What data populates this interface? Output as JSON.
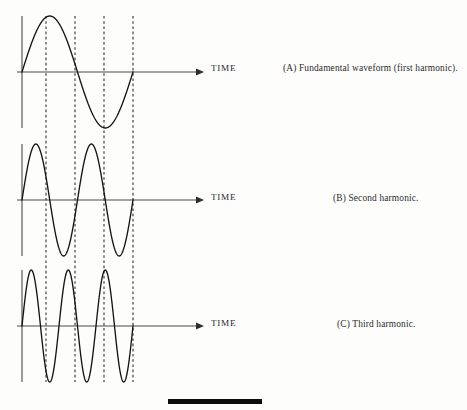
{
  "figure": {
    "background_color": "#fdfdfc",
    "ink_color": "#1a1a1a",
    "dashed_color": "#3a3a3a",
    "axis_color": "#4a4a4a"
  },
  "panels": [
    {
      "id": "A",
      "caption": "(A) Fundamental waveform (first harmonic).",
      "axis_label": "TIME",
      "harmonic_number": 1,
      "cycles": 1,
      "baseline_y": 72,
      "amplitude": 56
    },
    {
      "id": "B",
      "caption": "(B) Second harmonic.",
      "axis_label": "TIME",
      "harmonic_number": 2,
      "cycles": 2,
      "baseline_y": 200,
      "amplitude": 56
    },
    {
      "id": "C",
      "caption": "(C) Third harmonic.",
      "axis_label": "TIME",
      "harmonic_number": 3,
      "cycles": 3,
      "baseline_y": 326,
      "amplitude": 56
    }
  ],
  "geometry": {
    "origin_x": 22,
    "wave_end_x": 133,
    "axis_end_x": 203,
    "arrow_size": 5,
    "vertical_axis_top_a": 16,
    "vertical_axis_bottom_a": 128,
    "vertical_axis_top_b": 144,
    "vertical_axis_bottom_b": 256,
    "vertical_axis_top_c": 270,
    "vertical_axis_bottom_c": 382,
    "dashed_lines_x": [
      46,
      75,
      104,
      133
    ],
    "dashed_top": 16,
    "dashed_bottom": 382
  },
  "footer_rule": {
    "x": 168,
    "y": 399,
    "width": 94,
    "height": 5,
    "color": "#0d0d0d"
  },
  "chart_data": {
    "type": "line",
    "xlabel": "TIME",
    "ylabel": "",
    "x_range": [
      0,
      1
    ],
    "y_range": [
      -1,
      1
    ],
    "grid": false,
    "legend": "none",
    "series": [
      {
        "name": "(A) Fundamental waveform (first harmonic).",
        "waveform": "sine",
        "cycles_over_range": 1,
        "amplitude": 1,
        "phase_deg": 0
      },
      {
        "name": "(B) Second harmonic.",
        "waveform": "sine",
        "cycles_over_range": 2,
        "amplitude": 1,
        "phase_deg": 0
      },
      {
        "name": "(C) Third harmonic.",
        "waveform": "sine",
        "cycles_over_range": 3,
        "amplitude": 1,
        "phase_deg": 0
      }
    ],
    "annotations": [
      {
        "type": "vline",
        "x": 0.25,
        "style": "dashed"
      },
      {
        "type": "vline",
        "x": 0.5,
        "style": "dashed"
      },
      {
        "type": "vline",
        "x": 0.75,
        "style": "dashed"
      },
      {
        "type": "vline",
        "x": 1.0,
        "style": "dashed"
      }
    ]
  }
}
